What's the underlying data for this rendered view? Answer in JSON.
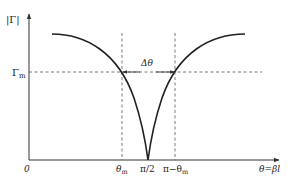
{
  "figure": {
    "y_axis_label": "|Γ|",
    "x_axis_label": "θ=βl",
    "origin_label": "0",
    "gamma_m_label": "Γ",
    "gamma_m_sub": "m",
    "delta_theta_label": "Δθ",
    "x_ticks": [
      {
        "main": "θ",
        "sub": "m"
      },
      {
        "main": "π/2",
        "sub": ""
      },
      {
        "main": "π−θ",
        "sub": "m"
      }
    ],
    "colors": {
      "curve": "#222222",
      "axis": "#333333",
      "dashed": "#555555",
      "background": "#ffffff"
    }
  }
}
